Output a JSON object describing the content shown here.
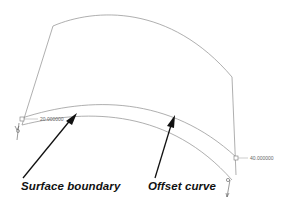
{
  "diagram": {
    "type": "cad-surface-offset",
    "labels": {
      "surface_boundary": "Surface boundary",
      "offset_curve": "Offset curve"
    },
    "dimensions": {
      "left_value": "20.000000",
      "right_value": "40.000000"
    },
    "colors": {
      "line": "#9a9a9a",
      "arrow": "#111111",
      "text": "#111111",
      "dim_text": "#666666",
      "background": "#ffffff"
    }
  }
}
